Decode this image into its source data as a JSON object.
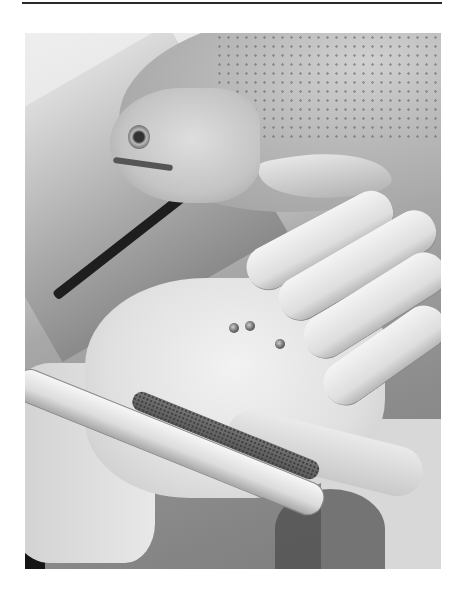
{
  "page": {
    "has_top_rule": true,
    "figure": {
      "type": "photograph",
      "color_mode": "grayscale",
      "subject": "Trout lying on concrete beside an open hand holding a sampling tube filled with gravel and eggs; three eggs resting on the palm",
      "elements": [
        "fish",
        "hand",
        "sampling-tube",
        "eggs",
        "concrete-ground"
      ],
      "egg_count_on_palm": 3
    }
  }
}
